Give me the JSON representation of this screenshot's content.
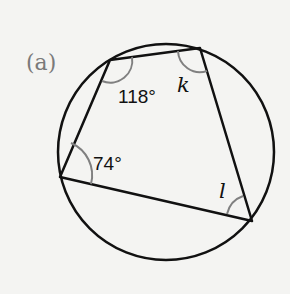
{
  "figure": {
    "part_label": "(a)",
    "angles": {
      "top_left": "118°",
      "top_right": "k",
      "left": "74°",
      "bottom_right": "l"
    },
    "colors": {
      "stroke": "#111111",
      "arc": "#808080",
      "background": "#f4f4f2",
      "part_label": "#7a7a7a"
    }
  }
}
